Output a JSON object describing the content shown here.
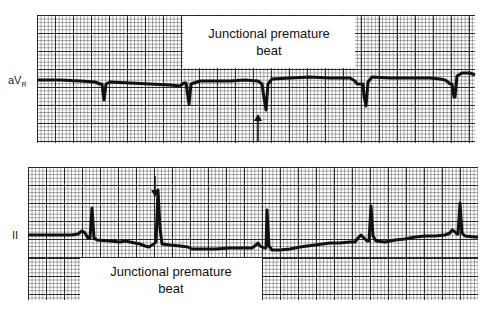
{
  "strips": [
    {
      "lead": "aV",
      "lead_sub": "R",
      "annotation": {
        "line1": "Junctional premature",
        "line2": "beat"
      },
      "arrow_direction": "up"
    },
    {
      "lead": "II",
      "lead_sub": "",
      "annotation": {
        "line1": "Junctional premature",
        "line2": "beat"
      },
      "arrow_direction": "down"
    }
  ],
  "colors": {
    "trace": "#111111",
    "grid": "#000000",
    "background": "#ffffff"
  }
}
